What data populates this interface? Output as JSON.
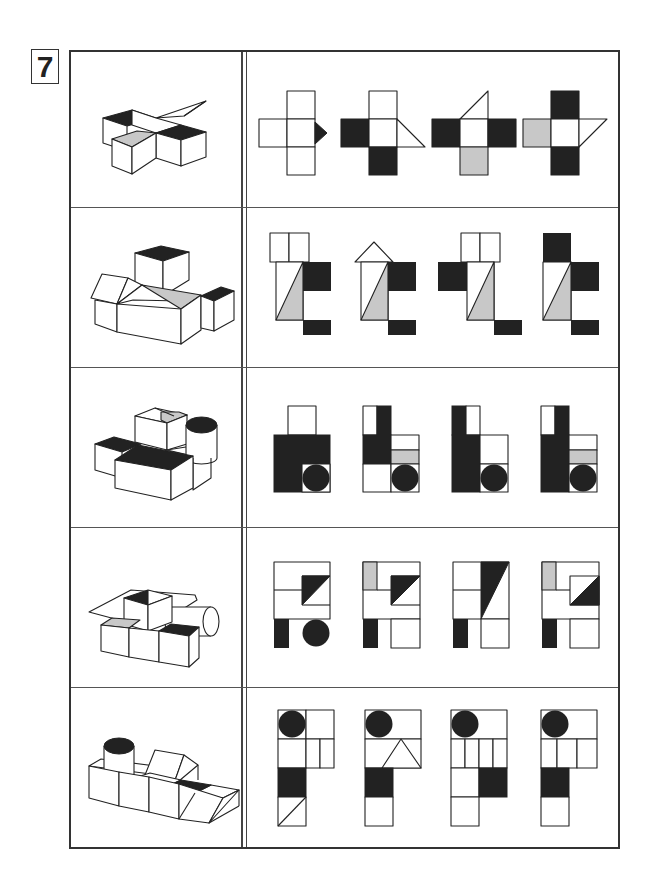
{
  "problem": {
    "number": "7"
  },
  "colors": {
    "dark": "#222222",
    "gray": "#c8c8c8",
    "white": "#ffffff",
    "line": "#222222"
  },
  "rows": [
    {
      "index": 1,
      "question": "cubes-with-black-tops-gray-top-and-triangle-wedge",
      "options": [
        "A",
        "B",
        "C",
        "D"
      ]
    },
    {
      "index": 2,
      "question": "house-shapes-with-black-cube-top-and-gray-triangle",
      "options": [
        "A",
        "B",
        "C",
        "D"
      ]
    },
    {
      "index": 3,
      "question": "blocks-with-cylinder-black-top-and-gray-stripe",
      "options": [
        "A",
        "B",
        "C",
        "D"
      ]
    },
    {
      "index": 4,
      "question": "blocks-with-pyramid-roof-cylinder-and-gray-strip",
      "options": [
        "A",
        "B",
        "C",
        "D"
      ]
    },
    {
      "index": 5,
      "question": "blocks-with-cylinder-prism-and-black-top",
      "options": [
        "A",
        "B",
        "C",
        "D"
      ]
    }
  ]
}
